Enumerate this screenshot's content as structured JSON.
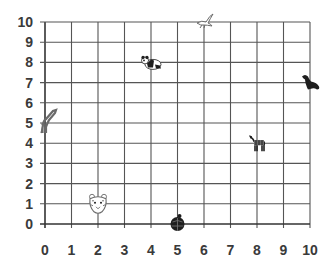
{
  "chart_data": {
    "type": "scatter",
    "title": "",
    "xlabel": "",
    "ylabel": "",
    "xlim": [
      0,
      10
    ],
    "ylim": [
      0,
      10
    ],
    "grid": true,
    "x_ticks": [
      "0",
      "1",
      "2",
      "3",
      "4",
      "5",
      "6",
      "7",
      "8",
      "9",
      "10"
    ],
    "y_ticks": [
      "0",
      "1",
      "2",
      "3",
      "4",
      "5",
      "6",
      "7",
      "8",
      "9",
      "10"
    ],
    "points": [
      {
        "name": "panda",
        "x": 4,
        "y": 8
      },
      {
        "name": "bird",
        "x": 6,
        "y": 10
      },
      {
        "name": "seal",
        "x": 10,
        "y": 7
      },
      {
        "name": "zebra",
        "x": 8,
        "y": 4
      },
      {
        "name": "giraffe",
        "x": 0,
        "y": 5
      },
      {
        "name": "tiger",
        "x": 2,
        "y": 1
      },
      {
        "name": "turtle",
        "x": 5,
        "y": 0
      }
    ]
  },
  "colors": {
    "grid": "#555555",
    "axis": "#333333",
    "label": "#3a3a3a",
    "icon_dark": "#1e1e1e",
    "icon_mid": "#6a6a6a"
  }
}
